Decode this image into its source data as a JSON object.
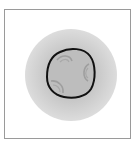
{
  "image": {
    "description": "Microscopy-style illustration of a round cell with a dark outline and three curved inner arcs, surrounded by a soft gray halo inside a thin bordered frame",
    "colors": {
      "frame_border": "#9a9a9a",
      "background": "#ffffff",
      "halo": "#c8c8c8",
      "cell_fill": "#bdbdbd",
      "cell_outline": "#111111",
      "inner_arcs": "#9e9e9e"
    },
    "icons": [
      "cell-icon"
    ]
  }
}
